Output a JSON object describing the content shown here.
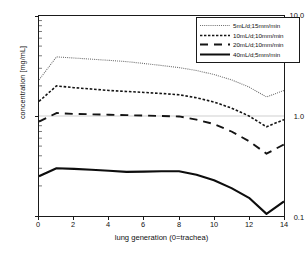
{
  "chart_data": {
    "type": "line",
    "title": "",
    "xlabel": "lung generation (0=trachea)",
    "ylabel": "concentration [mg/mL]",
    "xlim": [
      0,
      14
    ],
    "ylim": [
      0.1,
      10.0
    ],
    "yscale": "log",
    "grid": false,
    "legend_position": "top-right",
    "x": [
      0,
      1,
      2,
      3,
      4,
      5,
      6,
      7,
      8,
      9,
      10,
      11,
      12,
      13,
      14
    ],
    "x_tick_labels": [
      "0",
      "2",
      "4",
      "6",
      "8",
      "10",
      "12",
      "14"
    ],
    "x_ticks": [
      0,
      2,
      4,
      6,
      8,
      10,
      12,
      14
    ],
    "y_tick_labels": [
      "10.0",
      "1.0",
      "0.1"
    ],
    "y_ticks": [
      10.0,
      1.0,
      0.1
    ],
    "series": [
      {
        "name": "5mL/d;15mm/min",
        "style": "dotted",
        "color": "#6b6b6b",
        "width": 1.1,
        "values": [
          2.3,
          3.9,
          3.8,
          3.7,
          3.6,
          3.5,
          3.35,
          3.2,
          3.05,
          2.85,
          2.6,
          2.3,
          1.95,
          1.55,
          1.8
        ]
      },
      {
        "name": "10mL/d;10mm/min",
        "style": "dashed-short",
        "color": "#141414",
        "width": 1.6,
        "values": [
          1.4,
          2.0,
          1.92,
          1.86,
          1.8,
          1.76,
          1.72,
          1.68,
          1.63,
          1.52,
          1.38,
          1.2,
          1.0,
          0.78,
          0.92
        ]
      },
      {
        "name": "20mL/d;10mm/min",
        "style": "dashed-long",
        "color": "#141414",
        "width": 1.9,
        "values": [
          0.88,
          1.07,
          1.05,
          1.04,
          1.03,
          1.02,
          1.01,
          1.0,
          0.99,
          0.92,
          0.83,
          0.7,
          0.56,
          0.42,
          0.52
        ]
      },
      {
        "name": "40mL/d;5mm/min",
        "style": "solid",
        "color": "#0d0d0d",
        "width": 2.1,
        "values": [
          0.25,
          0.3,
          0.296,
          0.29,
          0.283,
          0.276,
          0.278,
          0.28,
          0.28,
          0.258,
          0.228,
          0.19,
          0.152,
          0.105,
          0.14
        ]
      }
    ]
  }
}
